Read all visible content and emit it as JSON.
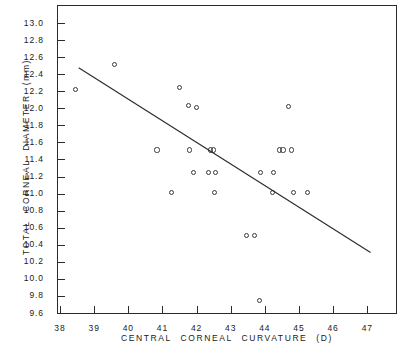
{
  "chart_data": {
    "type": "scatter",
    "title": "",
    "xlabel": "CENTRAL CORNEAL CURVATURE (D)",
    "ylabel": "TOTAL CORNEAL DIAMETER (mm)",
    "xlim": [
      38,
      47.9
    ],
    "ylim": [
      9.6,
      13.0
    ],
    "xticks": [
      38,
      39,
      40,
      41,
      42,
      43,
      44,
      45,
      46,
      47
    ],
    "xtick_labels": [
      "38",
      "39",
      "40",
      "41",
      "42",
      "43",
      "44",
      "45",
      "46",
      "47"
    ],
    "yticks": [
      9.6,
      9.8,
      10.0,
      10.2,
      10.4,
      10.6,
      10.8,
      11.0,
      11.2,
      11.4,
      11.6,
      11.8,
      12.0,
      12.2,
      12.4,
      12.6,
      12.8,
      13.0
    ],
    "ytick_labels": [
      "9.6",
      "9.8",
      "10.0",
      "10.2",
      "10.4",
      "10.6",
      "10.8",
      "11.0",
      "11.2",
      "11.4",
      "11.6",
      "11.8",
      "12.0",
      "12.2",
      "12.4",
      "12.6",
      "12.8",
      "13.0"
    ],
    "grid": false,
    "legend": false,
    "marker": "open-circle",
    "points": [
      {
        "x": 38.45,
        "y": 12.22
      },
      {
        "x": 39.6,
        "y": 12.51
      },
      {
        "x": 40.84,
        "y": 11.51
      },
      {
        "x": 41.27,
        "y": 11.01
      },
      {
        "x": 41.5,
        "y": 12.24
      },
      {
        "x": 41.77,
        "y": 12.03
      },
      {
        "x": 41.79,
        "y": 11.51
      },
      {
        "x": 41.92,
        "y": 11.25
      },
      {
        "x": 42.0,
        "y": 12.01
      },
      {
        "x": 42.36,
        "y": 11.25
      },
      {
        "x": 42.42,
        "y": 11.51
      },
      {
        "x": 42.5,
        "y": 11.51
      },
      {
        "x": 42.52,
        "y": 11.01
      },
      {
        "x": 42.55,
        "y": 11.25
      },
      {
        "x": 43.47,
        "y": 10.51
      },
      {
        "x": 43.7,
        "y": 10.51
      },
      {
        "x": 43.85,
        "y": 9.75
      },
      {
        "x": 43.87,
        "y": 11.25
      },
      {
        "x": 44.22,
        "y": 11.01
      },
      {
        "x": 44.25,
        "y": 11.25
      },
      {
        "x": 44.42,
        "y": 11.51
      },
      {
        "x": 44.53,
        "y": 11.51
      },
      {
        "x": 44.7,
        "y": 12.02
      },
      {
        "x": 44.78,
        "y": 11.51
      },
      {
        "x": 44.85,
        "y": 11.01
      },
      {
        "x": 45.25,
        "y": 11.01
      }
    ],
    "trendline": {
      "label": "regression-line",
      "x1": 38.55,
      "y1": 12.47,
      "x2": 47.15,
      "y2": 10.29
    }
  }
}
